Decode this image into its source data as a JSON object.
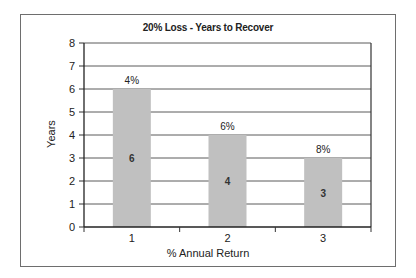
{
  "chart_data": {
    "type": "bar",
    "title": "20% Loss - Years to Recover",
    "xlabel": "% Annual Return",
    "ylabel": "Years",
    "categories": [
      "1",
      "2",
      "3"
    ],
    "values": [
      6,
      4,
      3
    ],
    "bar_top_labels": [
      "4%",
      "6%",
      "8%"
    ],
    "bar_inside_labels": [
      "6",
      "4",
      "3"
    ],
    "ylim": [
      0,
      8
    ],
    "yticks": [
      0,
      1,
      2,
      3,
      4,
      5,
      6,
      7,
      8
    ],
    "grid": true,
    "legend": "none",
    "bar_color": "#c0c0c0"
  }
}
